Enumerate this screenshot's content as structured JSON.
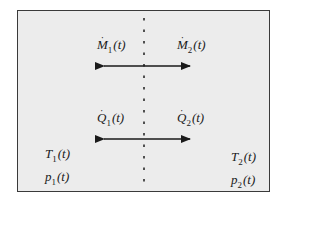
{
  "diagram": {
    "type": "two-subsystem exchange schematic",
    "divider": "dashed vertical line separating subsystem 1 (left) and subsystem 2 (right)",
    "mass_flow": {
      "left_label": {
        "symbol": "M",
        "dot": "·",
        "sub": "1",
        "arg": "(t)"
      },
      "right_label": {
        "symbol": "M",
        "dot": "·",
        "sub": "2",
        "arg": "(t)"
      },
      "arrow": "double-headed horizontal arrow"
    },
    "heat_flow": {
      "left_label": {
        "symbol": "Q",
        "dot": "·",
        "sub": "1",
        "arg": "(t)"
      },
      "right_label": {
        "symbol": "Q",
        "dot": "·",
        "sub": "2",
        "arg": "(t)"
      },
      "arrow": "double-headed horizontal arrow"
    },
    "state_left": {
      "temperature": {
        "symbol": "T",
        "sub": "1",
        "arg": "(t)"
      },
      "pressure": {
        "symbol": "p",
        "sub": "1",
        "arg": "(t)"
      }
    },
    "state_right": {
      "temperature": {
        "symbol": "T",
        "sub": "2",
        "arg": "(t)"
      },
      "pressure": {
        "symbol": "p",
        "sub": "2",
        "arg": "(t)"
      }
    }
  },
  "colors": {
    "background": "#ececec",
    "border": "#3a3a3a",
    "arrow": "#1a1a1a",
    "text": "#1a1a1a"
  }
}
